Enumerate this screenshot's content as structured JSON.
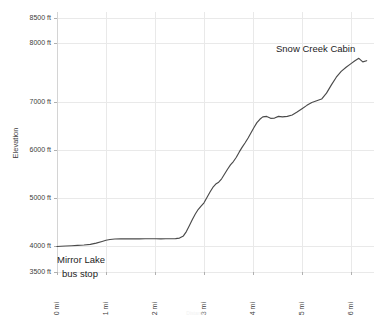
{
  "chart_data": {
    "type": "line",
    "title": "",
    "xlabel": "Distance",
    "ylabel": "Elevation",
    "xlim": [
      0,
      6.4
    ],
    "ylim": [
      3500,
      8500
    ],
    "grid": true,
    "legend": "none",
    "x_unit": "mi",
    "y_unit": "ft",
    "x_tick_labels": [
      "0 mi",
      "1 mi",
      "2 mi",
      "3 mi",
      "4 mi",
      "5 mi",
      "6 mi"
    ],
    "x_tick_values": [
      0,
      1,
      2,
      3,
      4,
      5,
      6
    ],
    "y_tick_labels": [
      "3500 ft",
      "4000 ft",
      "5000 ft",
      "6000 ft",
      "7000 ft",
      "8000 ft",
      "8500 ft"
    ],
    "y_tick_values": [
      3500,
      4000,
      5000,
      6000,
      7000,
      8000,
      8500
    ],
    "series": [
      {
        "name": "Trail elevation profile",
        "color": "#4a4a4a",
        "x": [
          0.0,
          0.08,
          0.18,
          0.3,
          0.42,
          0.55,
          0.68,
          0.8,
          0.92,
          1.0,
          1.08,
          1.18,
          1.3,
          1.42,
          1.55,
          1.68,
          1.8,
          1.92,
          2.02,
          2.12,
          2.22,
          2.32,
          2.42,
          2.5,
          2.58,
          2.64,
          2.7,
          2.76,
          2.82,
          2.88,
          2.94,
          3.0,
          3.06,
          3.12,
          3.18,
          3.24,
          3.3,
          3.36,
          3.42,
          3.48,
          3.54,
          3.6,
          3.66,
          3.72,
          3.78,
          3.84,
          3.9,
          3.96,
          4.02,
          4.08,
          4.14,
          4.2,
          4.28,
          4.36,
          4.44,
          4.52,
          4.6,
          4.7,
          4.8,
          4.9,
          5.0,
          5.1,
          5.2,
          5.3,
          5.4,
          5.5,
          5.6,
          5.7,
          5.8,
          5.9,
          6.0,
          6.08,
          6.16,
          6.24,
          6.32
        ],
        "y": [
          3990,
          3995,
          4000,
          4005,
          4012,
          4020,
          4035,
          4060,
          4095,
          4120,
          4135,
          4145,
          4150,
          4150,
          4148,
          4148,
          4150,
          4152,
          4150,
          4148,
          4150,
          4152,
          4155,
          4165,
          4210,
          4300,
          4420,
          4545,
          4660,
          4760,
          4830,
          4900,
          5010,
          5120,
          5220,
          5290,
          5330,
          5400,
          5500,
          5600,
          5690,
          5760,
          5850,
          5960,
          6060,
          6150,
          6250,
          6360,
          6470,
          6570,
          6640,
          6690,
          6700,
          6660,
          6665,
          6700,
          6690,
          6700,
          6730,
          6790,
          6860,
          6930,
          6990,
          7020,
          7050,
          7150,
          7290,
          7420,
          7520,
          7590,
          7650,
          7700,
          7740,
          7680,
          7700
        ]
      }
    ],
    "annotations": [
      {
        "id": "snow-creek-cabin",
        "lines": [
          "Snow Creek Cabin"
        ],
        "x_px": 276,
        "y_px": 52,
        "align": "start"
      },
      {
        "id": "mirror-lake-bus-stop",
        "lines": [
          "Mirror Lake",
          "bus stop"
        ],
        "x_px": 57,
        "y_px": 263,
        "align": "start"
      }
    ],
    "colors": {
      "line": "#4a4a4a",
      "grid": "#e9e9e9",
      "axis": "#d4d4d4",
      "text": "#3c3c3c",
      "annotation_text": "#1d1d1d",
      "background": "#ffffff"
    }
  }
}
